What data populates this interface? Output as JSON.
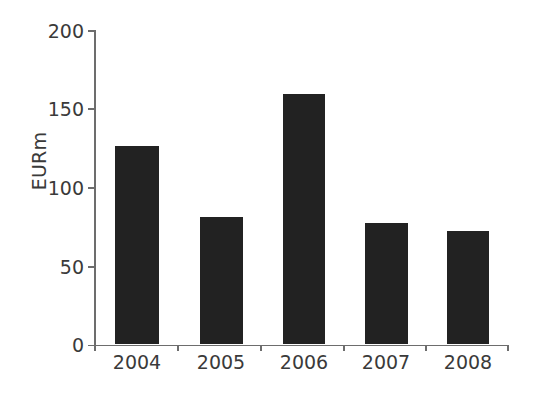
{
  "chart_data": {
    "type": "bar",
    "title": "",
    "subtitle": "",
    "xlabel": "",
    "ylabel": "EURm",
    "categories": [
      "2004",
      "2005",
      "2006",
      "2007",
      "2008"
    ],
    "values": [
      126,
      81,
      159,
      77,
      72
    ],
    "series": [
      {
        "name": "EURm",
        "values": [
          126,
          81,
          159,
          77,
          72
        ]
      }
    ],
    "ylim": [
      0,
      200
    ],
    "y_ticks": [
      0,
      50,
      100,
      150,
      200
    ],
    "y_tick_labels": [
      "0",
      "50",
      "100",
      "150",
      "200"
    ],
    "x_tick_labels": [
      "2004",
      "2005",
      "2006",
      "2007",
      "2008"
    ],
    "grid": false,
    "legend": false,
    "legend_position": "none",
    "annotations": [],
    "colors": {
      "bar": "#222222",
      "axis": "#6d6d6d",
      "text": "#3a3a3a",
      "background": "#ffffff"
    }
  },
  "axis": {
    "y_title": "EURm",
    "ticks_y": [
      {
        "label": "200",
        "value": 200
      },
      {
        "label": "150",
        "value": 150
      },
      {
        "label": "100",
        "value": 100
      },
      {
        "label": "50",
        "value": 50
      },
      {
        "label": "0",
        "value": 0
      }
    ],
    "ticks_x": [
      {
        "label": "2004"
      },
      {
        "label": "2005"
      },
      {
        "label": "2006"
      },
      {
        "label": "2007"
      },
      {
        "label": "2008"
      }
    ]
  }
}
